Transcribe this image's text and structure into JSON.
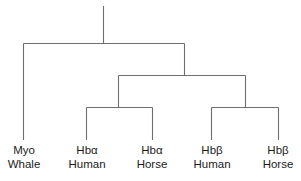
{
  "diagram": {
    "type": "phylogenetic-tree",
    "orientation": "top-down",
    "line_color": "#6e6e70",
    "text_color": "#1b1b1b",
    "background_color": "#ffffff",
    "leaves": [
      {
        "id": "myo-whale",
        "line1": "Myo",
        "line2": "Whale",
        "x": 24,
        "stem_top": 43
      },
      {
        "id": "hba-human",
        "line1": "Hbα",
        "line2": "Human",
        "x": 87,
        "stem_top": 107
      },
      {
        "id": "hba-horse",
        "line1": "Hbα",
        "line2": "Horse",
        "x": 152,
        "stem_top": 107
      },
      {
        "id": "hbb-human",
        "line1": "Hbβ",
        "line2": "Human",
        "x": 212,
        "stem_top": 107
      },
      {
        "id": "hbb-horse",
        "line1": "Hbβ",
        "line2": "Horse",
        "x": 278,
        "stem_top": 107
      }
    ],
    "nodes": {
      "root_stem": {
        "x": 103,
        "y_top": 6,
        "y_bottom": 43
      },
      "top_bar": {
        "y": 43,
        "x_left": 24,
        "x_right": 184
      },
      "globin_stem": {
        "x": 184,
        "y_top": 43,
        "y_bottom": 75
      },
      "globin_bar": {
        "y": 75,
        "x_left": 118,
        "x_right": 245
      },
      "alpha_stem": {
        "x": 118,
        "y_top": 75,
        "y_bottom": 107
      },
      "alpha_bar": {
        "y": 107,
        "x_left": 87,
        "x_right": 152
      },
      "beta_stem": {
        "x": 245,
        "y_top": 75,
        "y_bottom": 107
      },
      "beta_bar": {
        "y": 107,
        "x_left": 212,
        "x_right": 278
      },
      "leaf_stem_bottom": 140
    },
    "label_top": 143
  }
}
